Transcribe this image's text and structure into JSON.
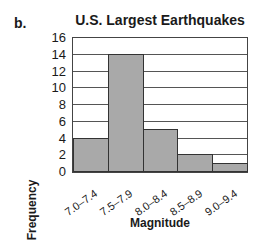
{
  "panel_label": "b.",
  "chart_data": {
    "type": "bar",
    "title": "U.S. Largest Earthquakes",
    "xlabel": "Magnitude",
    "ylabel": "Frequency",
    "categories": [
      "7.0–7.4",
      "7.5–7.9",
      "8.0–8.4",
      "8.5–8.9",
      "9.0–9.4"
    ],
    "values": [
      4,
      14,
      5,
      2,
      1
    ],
    "ylim": [
      0,
      16
    ],
    "yticks": [
      "0",
      "2",
      "4",
      "6",
      "8",
      "10",
      "12",
      "14",
      "16"
    ],
    "grid": true,
    "legend": null,
    "bar_color": "#a9a9a9",
    "histogram": true
  }
}
